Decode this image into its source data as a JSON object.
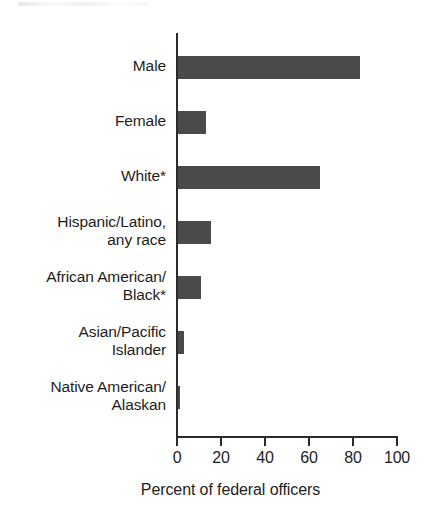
{
  "chart_data": {
    "type": "bar",
    "orientation": "horizontal",
    "title": "",
    "xlabel": "Percent of federal officers",
    "ylabel": "",
    "xlim": [
      0,
      100
    ],
    "xticks": [
      0,
      20,
      40,
      60,
      80,
      100
    ],
    "xtick_labels": [
      "0",
      "20",
      "40",
      "60",
      "80",
      "100"
    ],
    "grid": false,
    "legend": false,
    "bar_color": "#4a4a4a",
    "axis_color": "#2b2b2b",
    "categories": [
      "Male",
      "Female",
      "White*",
      "Hispanic/Latino, any race",
      "African American/ Black*",
      "Asian/Pacific Islander",
      "Native American/ Alaskan"
    ],
    "values": [
      83,
      13,
      65,
      15,
      10.5,
      2.7,
      1
    ],
    "bars": [
      {
        "label_line1": "Male",
        "label_line2": "",
        "value": 83
      },
      {
        "label_line1": "Female",
        "label_line2": "",
        "value": 13
      },
      {
        "label_line1": "White*",
        "label_line2": "",
        "value": 65
      },
      {
        "label_line1": "Hispanic/Latino,",
        "label_line2": "any race",
        "value": 15
      },
      {
        "label_line1": "African American/",
        "label_line2": "Black*",
        "value": 10.5
      },
      {
        "label_line1": "Asian/Pacific",
        "label_line2": "Islander",
        "value": 2.7
      },
      {
        "label_line1": "Native American/",
        "label_line2": "Alaskan",
        "value": 1
      }
    ]
  }
}
